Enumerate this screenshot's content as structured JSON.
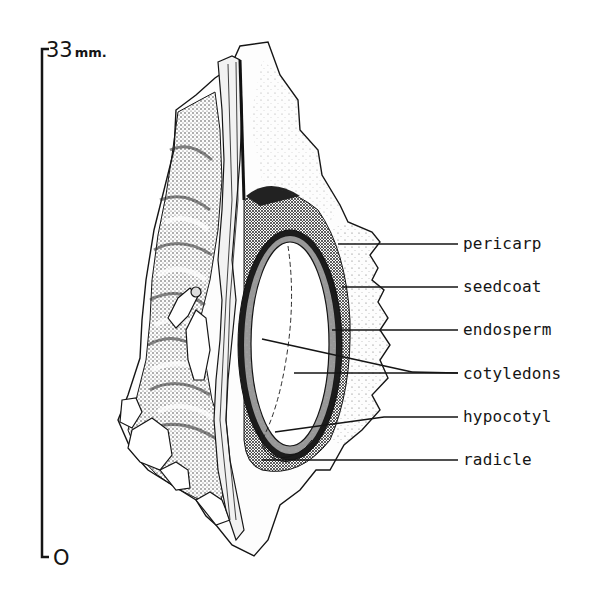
{
  "figure": {
    "scale_bar": {
      "top_value": "33",
      "top_unit": "mm.",
      "bottom_value": "O"
    },
    "labels": [
      {
        "id": "pericarp",
        "text": "pericarp",
        "y": 244
      },
      {
        "id": "seedcoat",
        "text": "seedcoat",
        "y": 287
      },
      {
        "id": "endosperm",
        "text": "endosperm",
        "y": 330
      },
      {
        "id": "cotyledons",
        "text": "cotyledons",
        "y": 374
      },
      {
        "id": "hypocotyl",
        "text": "hypocotyl",
        "y": 417
      },
      {
        "id": "radicle",
        "text": "radicle",
        "y": 460
      }
    ],
    "colors": {
      "ink": "#151515",
      "paper": "#ffffff",
      "stipple": "#555555"
    }
  }
}
